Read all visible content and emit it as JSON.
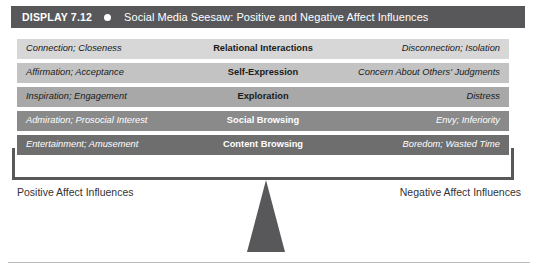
{
  "header": {
    "display_label": "DISPLAY 7.12",
    "bullet_icon": "filled-circle-icon",
    "title": "Social Media Seesaw: Positive and Negative Affect Influences",
    "bar_color": "#58585a",
    "text_color": "#ffffff"
  },
  "table": {
    "columns": [
      "Positive Affect",
      "Behavior",
      "Negative Affect"
    ],
    "rows": [
      {
        "left": "Connection; Closeness",
        "center": "Relational Interactions",
        "right": "Disconnection; Isolation",
        "bg": "#d7d7d7",
        "fg": "#1a1a1a"
      },
      {
        "left": "Affirmation; Acceptance",
        "center": "Self-Expression",
        "right": "Concern About Others' Judgments",
        "bg": "#c3c3c3",
        "fg": "#1a1a1a"
      },
      {
        "left": "Inspiration; Engagement",
        "center": "Exploration",
        "right": "Distress",
        "bg": "#a8a8a8",
        "fg": "#1a1a1a"
      },
      {
        "left": "Admiration; Prosocial Interest",
        "center": "Social Browsing",
        "right": "Envy; Inferiority",
        "bg": "#8a8a8a",
        "fg": "#ffffff"
      },
      {
        "left": "Entertainment; Amusement",
        "center": "Content Browsing",
        "right": "Boredom; Wasted Time",
        "bg": "#6e6e6e",
        "fg": "#ffffff"
      }
    ]
  },
  "captions": {
    "left": "Positive Affect Influences",
    "right": "Negative Affect Influences"
  },
  "fulcrum": {
    "icon": "triangle-fulcrum-icon",
    "color": "#58585a"
  },
  "frame": {
    "color": "#58585a"
  },
  "bottom_rule": {
    "color": "#b9b9b9"
  }
}
